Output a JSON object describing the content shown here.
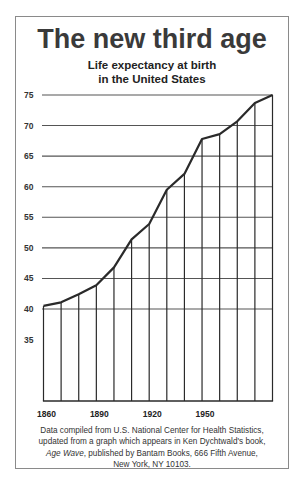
{
  "header": {
    "title": "The new third age",
    "subtitle_line1": "Life expectancy at birth",
    "subtitle_line2": "in the United States"
  },
  "caption": {
    "line1": "Data compiled from U.S. National Center for Health Statistics,",
    "line2": "updated from a graph which appears in  Ken Dychtwald's book,",
    "line3_italic": "Age Wave",
    "line3_rest": ", published by Bantam Books, 666 Fifth Avenue,",
    "line4": "New York, NY 10103."
  },
  "colors": {
    "line": "#2a2a2a",
    "grid": "#555555",
    "frame": "#8a8a8a",
    "text": "#333333"
  },
  "chart_data": {
    "type": "line",
    "title": "The new third age",
    "subtitle": "Life expectancy at birth in the United States",
    "xlabel": "",
    "ylabel": "",
    "x": [
      1860,
      1870,
      1880,
      1890,
      1900,
      1910,
      1920,
      1930,
      1940,
      1950,
      1960,
      1970,
      1980,
      1990
    ],
    "series": [
      {
        "name": "Life expectancy at birth (US)",
        "values": [
          40.5,
          41.1,
          42.4,
          43.9,
          46.8,
          51.4,
          53.9,
          59.5,
          62.1,
          67.8,
          68.6,
          70.7,
          73.7,
          75.0
        ]
      }
    ],
    "x_tick_labels": [
      "1860",
      "1890",
      "1920",
      "1950"
    ],
    "y_tick_labels": [
      "75",
      "70",
      "65",
      "60",
      "55",
      "50",
      "45",
      "40",
      "35"
    ],
    "y_gridlines": [
      75,
      70,
      65,
      60,
      55,
      50,
      45,
      40
    ],
    "ylim": [
      25,
      75
    ],
    "xlim": [
      1860,
      1990
    ],
    "grid": true,
    "drop_lines": true,
    "legend": null,
    "source_note": "Data compiled from U.S. National Center for Health Statistics, updated from a graph which appears in Ken Dychtwald's book, Age Wave, published by Bantam Books, 666 Fifth Avenue, New York, NY 10103."
  }
}
